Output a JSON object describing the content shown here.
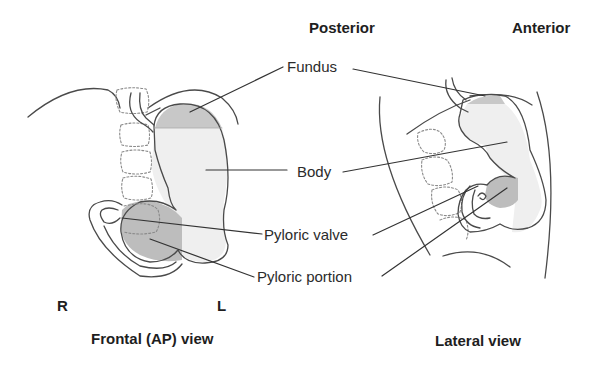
{
  "diagram": {
    "orientation_labels": {
      "posterior": "Posterior",
      "anterior": "Anterior",
      "right": "R",
      "left": "L"
    },
    "structure_labels": {
      "fundus": "Fundus",
      "body": "Body",
      "pyloric_valve": "Pyloric valve",
      "pyloric_portion": "Pyloric portion"
    },
    "view_captions": {
      "frontal": "Frontal (AP) view",
      "lateral": "Lateral view"
    },
    "colors": {
      "outline": "#4a4a4a",
      "fundus_fill": "#c8c8c8",
      "body_fill": "#efefef",
      "pyloric_fill": "#bdbdbd",
      "vertebra_dash": "#8a8a8a",
      "leader_line": "#333333"
    }
  }
}
